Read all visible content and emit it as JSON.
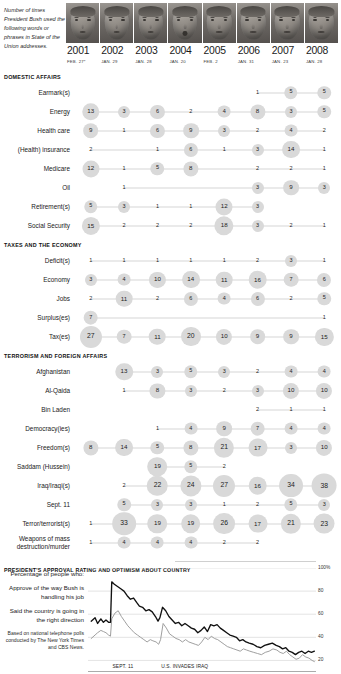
{
  "caption": "Number of times President Bush used the following words or phrases in State of the Union addresses.",
  "years": [
    {
      "year": "2001",
      "date": "FEB. 27*"
    },
    {
      "year": "2002",
      "date": "JAN. 29"
    },
    {
      "year": "2003",
      "date": "JAN. 28"
    },
    {
      "year": "2004",
      "date": "JAN. 20"
    },
    {
      "year": "2005",
      "date": "FEB. 2"
    },
    {
      "year": "2006",
      "date": "JAN. 31"
    },
    {
      "year": "2007",
      "date": "JAN. 23"
    },
    {
      "year": "2008",
      "date": "JAN. 28"
    }
  ],
  "sections": [
    {
      "title": "DOMESTIC AFFAIRS",
      "rows": [
        {
          "label": "Earmark(s)",
          "values": [
            null,
            null,
            null,
            null,
            null,
            1,
            5,
            5
          ]
        },
        {
          "label": "Energy",
          "values": [
            13,
            3,
            6,
            2,
            4,
            8,
            3,
            5
          ]
        },
        {
          "label": "Health care",
          "values": [
            9,
            1,
            6,
            9,
            3,
            2,
            4,
            2
          ]
        },
        {
          "label": "(Health) insurance",
          "values": [
            2,
            null,
            1,
            6,
            1,
            3,
            14,
            1
          ]
        },
        {
          "label": "Medicare",
          "values": [
            12,
            1,
            5,
            8,
            null,
            2,
            2,
            1
          ]
        },
        {
          "label": "Oil",
          "values": [
            null,
            1,
            null,
            null,
            null,
            3,
            9,
            3
          ]
        },
        {
          "label": "Retirement(s)",
          "values": [
            5,
            3,
            1,
            1,
            12,
            3,
            null,
            null
          ]
        },
        {
          "label": "Social Security",
          "values": [
            15,
            2,
            2,
            2,
            18,
            3,
            2,
            1
          ]
        }
      ]
    },
    {
      "title": "TAXES AND THE ECONOMY",
      "rows": [
        {
          "label": "Deficit(s)",
          "values": [
            1,
            1,
            1,
            1,
            1,
            2,
            3,
            1
          ]
        },
        {
          "label": "Economy",
          "values": [
            3,
            4,
            10,
            14,
            11,
            16,
            7,
            6
          ]
        },
        {
          "label": "Jobs",
          "values": [
            2,
            11,
            2,
            6,
            4,
            6,
            2,
            5
          ]
        },
        {
          "label": "Surplus(es)",
          "values": [
            7,
            null,
            null,
            null,
            null,
            null,
            null,
            1
          ]
        },
        {
          "label": "Tax(es)",
          "values": [
            27,
            7,
            11,
            20,
            10,
            9,
            9,
            15
          ]
        }
      ]
    },
    {
      "title": "TERRORISM AND FOREIGN AFFAIRS",
      "rows": [
        {
          "label": "Afghanistan",
          "values": [
            null,
            13,
            3,
            5,
            3,
            2,
            4,
            4
          ]
        },
        {
          "label": "Al-Qaida",
          "values": [
            null,
            1,
            8,
            3,
            2,
            3,
            10,
            10
          ]
        },
        {
          "label": "Bin Laden",
          "values": [
            null,
            null,
            null,
            null,
            null,
            2,
            1,
            1
          ]
        },
        {
          "label": "Democracy(ies)",
          "values": [
            null,
            null,
            1,
            4,
            9,
            7,
            4,
            4
          ]
        },
        {
          "label": "Freedom(s)",
          "values": [
            8,
            14,
            5,
            8,
            21,
            17,
            3,
            10
          ]
        },
        {
          "label": "Saddam (Hussein)",
          "values": [
            null,
            null,
            19,
            5,
            2,
            null,
            null,
            null
          ]
        },
        {
          "label": "Iraq/Iraqi(s)",
          "values": [
            null,
            2,
            22,
            24,
            27,
            16,
            34,
            38
          ]
        },
        {
          "label": "Sept. 11",
          "values": [
            null,
            5,
            3,
            3,
            1,
            2,
            5,
            3
          ]
        },
        {
          "label": "Terror/terrorist(s)",
          "values": [
            1,
            33,
            19,
            19,
            26,
            17,
            21,
            23
          ]
        },
        {
          "label": "Weapons of mass destruction/murder",
          "values": [
            1,
            4,
            4,
            4,
            2,
            2,
            null,
            null
          ]
        }
      ]
    }
  ],
  "chart": {
    "title": "PRESIDENT'S APPROVAL RATING AND OPTIMISM ABOUT COUNTRY",
    "legend_heading": "Percentage of people who:",
    "series_labels": [
      "Approve of the way Bush is handling his job",
      "Said the country is going in the right direction"
    ],
    "source_note": "Based on national telephone polls conducted by The New York Times and CBS News.",
    "y_ticks": [
      "100%",
      "80",
      "60",
      "40",
      "20"
    ],
    "x_ticks": [
      "2001",
      "2002",
      "2003",
      "2004",
      "2005",
      "2006",
      "2007",
      "2008"
    ],
    "events": [
      {
        "label": "SEPT. 11",
        "x": 2001.7
      },
      {
        "label": "U.S. INVADES IRAQ",
        "x": 2003.22
      }
    ]
  },
  "chart_data": {
    "type": "line",
    "title": "PRESIDENT'S APPROVAL RATING AND OPTIMISM ABOUT COUNTRY",
    "xlabel": "",
    "ylabel": "Percentage of people who:",
    "ylim": [
      10,
      100
    ],
    "xlim": [
      2001.0,
      2008.1
    ],
    "grid": true,
    "legend_position": "left",
    "y_ticks": [
      20,
      40,
      60,
      80,
      100
    ],
    "x_ticks": [
      2001,
      2002,
      2003,
      2004,
      2005,
      2006,
      2007,
      2008
    ],
    "series": [
      {
        "name": "Approve of the way Bush is handling his job",
        "color": "#111111",
        "x": [
          2001.1,
          2001.22,
          2001.3,
          2001.4,
          2001.48,
          2001.56,
          2001.64,
          2001.7,
          2001.74,
          2001.82,
          2001.92,
          2002.02,
          2002.12,
          2002.22,
          2002.32,
          2002.42,
          2002.52,
          2002.6,
          2002.7,
          2002.8,
          2002.9,
          2003.0,
          2003.1,
          2003.18,
          2003.24,
          2003.32,
          2003.42,
          2003.52,
          2003.62,
          2003.72,
          2003.82,
          2003.92,
          2004.02,
          2004.12,
          2004.22,
          2004.32,
          2004.42,
          2004.52,
          2004.62,
          2004.72,
          2004.82,
          2004.92,
          2005.02,
          2005.12,
          2005.22,
          2005.32,
          2005.42,
          2005.52,
          2005.62,
          2005.72,
          2005.82,
          2005.92,
          2006.02,
          2006.14,
          2006.26,
          2006.38,
          2006.5,
          2006.62,
          2006.74,
          2006.86,
          2006.96,
          2007.06,
          2007.16,
          2007.26,
          2007.36,
          2007.46,
          2007.56,
          2007.66,
          2007.76,
          2007.86,
          2007.96,
          2008.05
        ],
        "y": [
          54,
          57,
          52,
          56,
          53,
          55,
          53,
          53,
          88,
          86,
          84,
          82,
          80,
          76,
          73,
          74,
          70,
          67,
          66,
          63,
          64,
          62,
          58,
          54,
          57,
          66,
          63,
          58,
          55,
          52,
          53,
          50,
          52,
          50,
          48,
          47,
          44,
          46,
          49,
          45,
          51,
          50,
          51,
          48,
          46,
          44,
          42,
          41,
          40,
          37,
          38,
          36,
          35,
          34,
          32,
          31,
          33,
          34,
          35,
          33,
          32,
          30,
          31,
          28,
          27,
          25,
          27,
          28,
          26,
          28,
          27,
          28
        ]
      },
      {
        "name": "Said the country is going in the right direction",
        "color": "#9a9a9a",
        "x": [
          2001.1,
          2001.22,
          2001.3,
          2001.4,
          2001.48,
          2001.56,
          2001.64,
          2001.7,
          2001.74,
          2001.84,
          2001.94,
          2002.04,
          2002.14,
          2002.24,
          2002.34,
          2002.44,
          2002.54,
          2002.64,
          2002.74,
          2002.84,
          2002.94,
          2003.02,
          2003.12,
          2003.2,
          2003.26,
          2003.34,
          2003.44,
          2003.54,
          2003.64,
          2003.74,
          2003.84,
          2003.94,
          2004.04,
          2004.14,
          2004.24,
          2004.34,
          2004.44,
          2004.54,
          2004.64,
          2004.74,
          2004.84,
          2004.94,
          2005.04,
          2005.14,
          2005.24,
          2005.34,
          2005.44,
          2005.54,
          2005.64,
          2005.74,
          2005.84,
          2005.94,
          2006.04,
          2006.16,
          2006.28,
          2006.4,
          2006.52,
          2006.64,
          2006.76,
          2006.88,
          2006.98,
          2007.08,
          2007.18,
          2007.28,
          2007.38,
          2007.48,
          2007.58,
          2007.68,
          2007.78,
          2007.88,
          2007.98,
          2008.05
        ],
        "y": [
          39,
          42,
          44,
          46,
          45,
          44,
          42,
          41,
          56,
          61,
          63,
          58,
          54,
          50,
          47,
          44,
          42,
          40,
          38,
          36,
          38,
          37,
          36,
          34,
          38,
          52,
          48,
          43,
          41,
          39,
          38,
          36,
          38,
          36,
          35,
          34,
          33,
          36,
          40,
          38,
          41,
          39,
          38,
          36,
          34,
          32,
          31,
          30,
          29,
          28,
          30,
          29,
          28,
          27,
          26,
          25,
          27,
          28,
          30,
          29,
          27,
          26,
          28,
          25,
          23,
          21,
          22,
          25,
          23,
          22,
          20,
          19
        ]
      }
    ]
  }
}
